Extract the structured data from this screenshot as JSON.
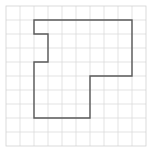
{
  "figure": {
    "title": "",
    "background_color": "#ffffff",
    "canvas": {
      "width": 152,
      "height": 152
    }
  },
  "grid": {
    "name": "square-grid",
    "origin_x": 6,
    "origin_y": 6,
    "cell_size": 14,
    "columns": 10,
    "rows": 10,
    "line_color": "#dcdcdc",
    "border_color": "#d2d2d2",
    "line_width": 0.8
  },
  "shape": {
    "name": "notched-L-polygon",
    "stroke_color": "#595959",
    "stroke_width": 1.4,
    "fill": "none",
    "vertices_grid": [
      [
        2,
        1
      ],
      [
        9,
        1
      ],
      [
        9,
        5
      ],
      [
        6,
        5
      ],
      [
        6,
        8
      ],
      [
        2,
        8
      ],
      [
        2,
        4
      ],
      [
        3,
        4
      ],
      [
        3,
        2
      ],
      [
        2,
        2
      ]
    ],
    "closed": true,
    "vertex_count": 10,
    "side_lengths_cells": [
      7,
      4,
      3,
      3,
      4,
      4,
      1,
      2,
      1,
      1
    ],
    "area_cells": 37,
    "perimeter_cells": 30
  }
}
